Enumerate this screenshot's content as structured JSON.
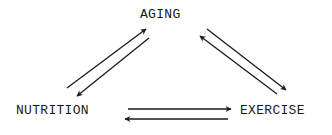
{
  "diagram": {
    "type": "cycle",
    "nodes": [
      {
        "id": "aging",
        "label": "AGING"
      },
      {
        "id": "nutrition",
        "label": "NUTRITION"
      },
      {
        "id": "exercise",
        "label": "EXERCISE"
      }
    ],
    "edges": [
      {
        "from": "nutrition",
        "to": "aging"
      },
      {
        "from": "aging",
        "to": "nutrition"
      },
      {
        "from": "aging",
        "to": "exercise"
      },
      {
        "from": "exercise",
        "to": "aging"
      },
      {
        "from": "nutrition",
        "to": "exercise"
      },
      {
        "from": "exercise",
        "to": "nutrition"
      }
    ],
    "colors": {
      "ink": "#1a1a1a",
      "background": "#ffffff"
    }
  }
}
